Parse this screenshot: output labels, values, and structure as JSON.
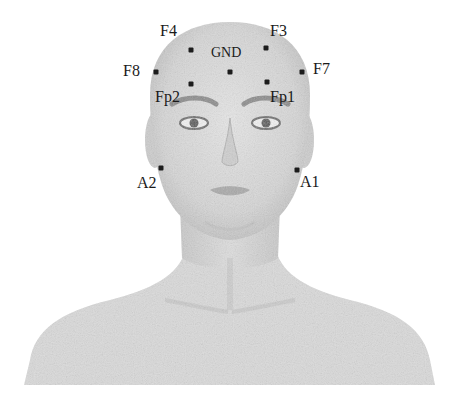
{
  "figure": {
    "type": "eeg-electrode-placement",
    "colors": {
      "skin": "#d9d9d9",
      "skin_shadow": "#b8b8b8",
      "dot": "#1c1c1c",
      "label": "#1a1a1a",
      "background": "#ffffff"
    }
  },
  "electrodes": [
    {
      "id": "F4",
      "label": "F4",
      "dot": [
        191,
        50
      ],
      "label_pos": [
        160,
        22
      ]
    },
    {
      "id": "F3",
      "label": "F3",
      "dot": [
        266,
        48
      ],
      "label_pos": [
        270,
        22
      ]
    },
    {
      "id": "F8",
      "label": "F8",
      "dot": [
        156,
        72
      ],
      "label_pos": [
        123,
        62
      ]
    },
    {
      "id": "GND",
      "label": "GND",
      "dot": [
        230,
        72
      ],
      "label_pos": [
        211,
        44
      ]
    },
    {
      "id": "F7",
      "label": "F7",
      "dot": [
        302,
        72
      ],
      "label_pos": [
        313,
        60
      ]
    },
    {
      "id": "Fp2",
      "label": "Fp2",
      "dot": [
        191,
        84
      ],
      "label_pos": [
        155,
        88
      ]
    },
    {
      "id": "Fp1",
      "label": "Fp1",
      "dot": [
        267,
        82
      ],
      "label_pos": [
        270,
        88
      ]
    },
    {
      "id": "A2",
      "label": "A2",
      "dot": [
        161,
        168
      ],
      "label_pos": [
        137,
        174
      ]
    },
    {
      "id": "A1",
      "label": "A1",
      "dot": [
        297,
        170
      ],
      "label_pos": [
        299,
        173
      ]
    }
  ],
  "labels": {
    "F4": "F4",
    "F3": "F3",
    "F8": "F8",
    "GND": "GND",
    "F7": "F7",
    "Fp2": "Fp2",
    "Fp1": "Fp1",
    "A2": "A2",
    "A1": "A1"
  }
}
